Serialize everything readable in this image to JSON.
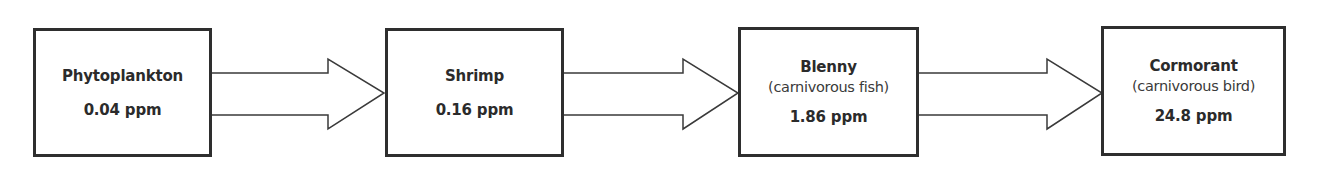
{
  "diagram": {
    "type": "food-chain flow",
    "nodes": [
      {
        "name": "Phytoplankton",
        "description": "",
        "value": "0.04 ppm"
      },
      {
        "name": "Shrimp",
        "description": "",
        "value": "0.16 ppm"
      },
      {
        "name": "Blenny",
        "description": "(carnivorous fish)",
        "value": "1.86 ppm"
      },
      {
        "name": "Cormorant",
        "description": "(carnivorous bird)",
        "value": "24.8 ppm"
      }
    ],
    "edges": [
      {
        "from": "Phytoplankton",
        "to": "Shrimp"
      },
      {
        "from": "Shrimp",
        "to": "Blenny"
      },
      {
        "from": "Blenny",
        "to": "Cormorant"
      }
    ],
    "colors": {
      "stroke": "#2e2e2e",
      "background": "#ffffff",
      "text": "#2b2b2b"
    }
  }
}
